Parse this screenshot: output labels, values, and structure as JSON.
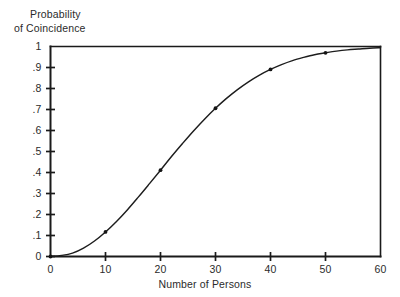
{
  "chart_data": {
    "type": "line",
    "title": "",
    "ylabel_line1": "Probability",
    "ylabel_line2": "of Coincidence",
    "xlabel": "Number of Persons",
    "xlim": [
      0,
      60
    ],
    "ylim": [
      0,
      1
    ],
    "grid": false,
    "legend": false,
    "xticks": [
      0,
      10,
      20,
      30,
      40,
      50,
      60
    ],
    "xtick_labels": [
      "0",
      "10",
      "20",
      "30",
      "40",
      "50",
      "60"
    ],
    "yticks": [
      0,
      0.1,
      0.2,
      0.3,
      0.4,
      0.5,
      0.6,
      0.7,
      0.8,
      0.9,
      1
    ],
    "ytick_labels": [
      "0",
      ".1",
      ".2",
      ".3",
      ".4",
      ".5",
      ".6",
      ".7",
      ".8",
      ".9",
      "1"
    ],
    "series": [
      {
        "name": "Probability of Coincidence",
        "color": "#1d1d1d",
        "x": [
          0,
          2,
          4,
          6,
          8,
          10,
          12,
          14,
          16,
          18,
          20,
          22,
          24,
          26,
          28,
          30,
          32,
          34,
          36,
          38,
          40,
          42,
          44,
          46,
          48,
          50,
          52,
          54,
          56,
          58,
          60
        ],
        "y": [
          0.0,
          0.005,
          0.016,
          0.04,
          0.074,
          0.117,
          0.167,
          0.223,
          0.284,
          0.347,
          0.411,
          0.476,
          0.538,
          0.598,
          0.654,
          0.706,
          0.753,
          0.795,
          0.832,
          0.864,
          0.891,
          0.914,
          0.933,
          0.948,
          0.961,
          0.97,
          0.978,
          0.984,
          0.988,
          0.992,
          0.994
        ]
      }
    ],
    "markers": [
      {
        "x": 0,
        "y": 0.0
      },
      {
        "x": 10,
        "y": 0.117
      },
      {
        "x": 20,
        "y": 0.411
      },
      {
        "x": 30,
        "y": 0.706
      },
      {
        "x": 40,
        "y": 0.891
      },
      {
        "x": 50,
        "y": 0.97
      }
    ]
  },
  "colors": {
    "background": "#ffffff",
    "axis": "#1a1a1a",
    "curve": "#1d1d1d",
    "text": "#2b2b2b"
  }
}
